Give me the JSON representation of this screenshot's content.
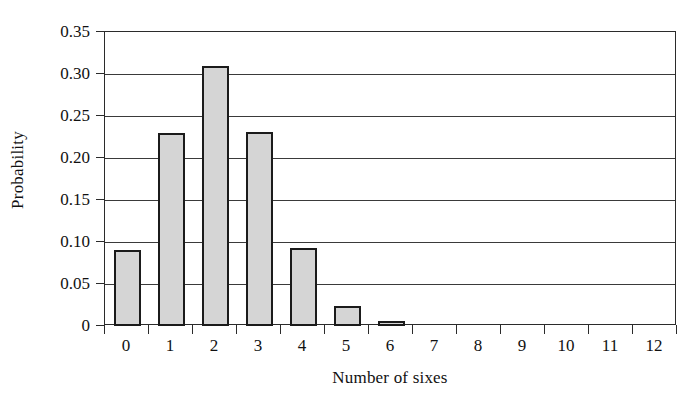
{
  "chart_data": {
    "type": "bar",
    "title": "",
    "xlabel": "Number of sixes",
    "ylabel": "Probability",
    "categories": [
      "0",
      "1",
      "2",
      "3",
      "4",
      "5",
      "6",
      "7",
      "8",
      "9",
      "10",
      "11",
      "12"
    ],
    "values": [
      0.09,
      0.23,
      0.31,
      0.231,
      0.093,
      0.024,
      0.006,
      0,
      0,
      0,
      0,
      0,
      0
    ],
    "ylim": [
      0,
      0.35
    ],
    "y_ticks": [
      0,
      0.05,
      0.1,
      0.15,
      0.2,
      0.25,
      0.3,
      0.35
    ],
    "y_tick_labels": [
      "0",
      "0.05",
      "0.10",
      "0.15",
      "0.20",
      "0.25",
      "0.30",
      "0.35"
    ],
    "grid": "horizontal",
    "legend": "none",
    "bar_fill_color": "#d5d5d5",
    "bar_edge_color": "#1b1b1b",
    "axis_color": "#2b2b2b",
    "background_color": "#ffffff"
  }
}
